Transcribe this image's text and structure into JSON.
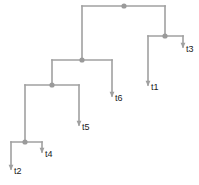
{
  "figure": {
    "type": "phylogenetic-tree",
    "layout": "rectangular-cladogram",
    "orientation": "right",
    "width": 199,
    "height": 185,
    "background_color": "#ffffff",
    "branch_color": "#a0a0a0",
    "branch_width": 1.6,
    "node_color": "#9a9a9a",
    "node_radius": 2.6,
    "label_color": "#1a1a1a",
    "label_font_size": 9
  },
  "tips": [
    {
      "id": "t1",
      "label": "t1",
      "x": 148,
      "y": 85,
      "label_x": 151,
      "label_y": 90
    },
    {
      "id": "t3",
      "label": "t3",
      "x": 183,
      "y": 47,
      "label_x": 186,
      "label_y": 52
    },
    {
      "id": "t6",
      "label": "t6",
      "x": 112,
      "y": 96,
      "label_x": 115,
      "label_y": 101
    },
    {
      "id": "t5",
      "label": "t5",
      "x": 79,
      "y": 125,
      "label_x": 82,
      "label_y": 130
    },
    {
      "id": "t4",
      "label": "t4",
      "x": 42,
      "y": 152,
      "label_x": 45,
      "label_y": 157
    },
    {
      "id": "t2",
      "label": "t2",
      "x": 11,
      "y": 169,
      "label_x": 14,
      "label_y": 174
    }
  ],
  "internal_nodes": [
    {
      "id": "n1",
      "name": "root",
      "x": 124,
      "y": 6,
      "child_x": [
        82,
        165
      ]
    },
    {
      "id": "n2",
      "name": "clade-t1-t3",
      "x": 165,
      "y": 36,
      "child_x": [
        148,
        183
      ]
    },
    {
      "id": "n3",
      "name": "clade-left",
      "x": 82,
      "y": 60,
      "child_x": [
        52,
        112
      ]
    },
    {
      "id": "n4",
      "name": "clade-t5",
      "x": 52,
      "y": 85,
      "child_x": [
        25,
        79
      ]
    },
    {
      "id": "n5",
      "name": "clade-t2-t4",
      "x": 25,
      "y": 142,
      "child_x": [
        11,
        42
      ]
    }
  ],
  "edges": [
    {
      "name": "root-to-n3",
      "from_x": 82,
      "from_y": 6,
      "to_x": 82,
      "to_y": 60
    },
    {
      "name": "root-to-n2",
      "from_x": 165,
      "from_y": 6,
      "to_x": 165,
      "to_y": 36
    },
    {
      "name": "root-bar",
      "from_x": 82,
      "from_y": 6,
      "to_x": 165,
      "to_y": 6
    },
    {
      "name": "n2-bar",
      "from_x": 148,
      "from_y": 36,
      "to_x": 183,
      "to_y": 36
    },
    {
      "name": "n2-to-t1",
      "from_x": 148,
      "from_y": 36,
      "to_x": 148,
      "to_y": 85
    },
    {
      "name": "n2-to-t3",
      "from_x": 183,
      "from_y": 36,
      "to_x": 183,
      "to_y": 47
    },
    {
      "name": "n3-bar",
      "from_x": 52,
      "from_y": 60,
      "to_x": 112,
      "to_y": 60
    },
    {
      "name": "n3-to-n4",
      "from_x": 52,
      "from_y": 60,
      "to_x": 52,
      "to_y": 85
    },
    {
      "name": "n3-to-t6",
      "from_x": 112,
      "from_y": 60,
      "to_x": 112,
      "to_y": 96
    },
    {
      "name": "n4-bar",
      "from_x": 25,
      "from_y": 85,
      "to_x": 79,
      "to_y": 85
    },
    {
      "name": "n4-to-n5",
      "from_x": 25,
      "from_y": 85,
      "to_x": 25,
      "to_y": 142
    },
    {
      "name": "n4-to-t5",
      "from_x": 79,
      "from_y": 85,
      "to_x": 79,
      "to_y": 125
    },
    {
      "name": "n5-bar",
      "from_x": 11,
      "from_y": 142,
      "to_x": 42,
      "to_y": 142
    },
    {
      "name": "n5-to-t2",
      "from_x": 11,
      "from_y": 142,
      "to_x": 11,
      "to_y": 169
    },
    {
      "name": "n5-to-t4",
      "from_x": 42,
      "from_y": 142,
      "to_x": 42,
      "to_y": 152
    }
  ]
}
